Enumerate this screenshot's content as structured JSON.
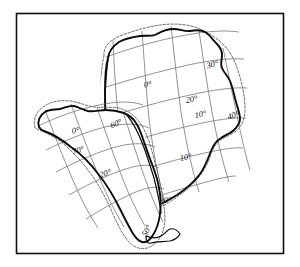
{
  "figure": {
    "caption": "",
    "background_color": "#ffffff",
    "frame_color": "#101010",
    "coastline_color": "#0b0b0b",
    "shelf_color": "#5a5a5a",
    "graticule_color": "#6e6e6e"
  },
  "frame": {
    "x": 16,
    "y": 13,
    "width": 268,
    "height": 241
  },
  "continents": [
    {
      "name": "africa",
      "label": "Africa",
      "grid_labels": [
        {
          "text": "0°",
          "x": 148,
          "y": 87,
          "rotate": -8
        },
        {
          "text": "30°",
          "x": 213,
          "y": 67,
          "rotate": -14
        },
        {
          "text": "20°",
          "x": 192,
          "y": 102,
          "rotate": -10
        },
        {
          "text": "10°",
          "x": 201,
          "y": 117,
          "rotate": -12
        },
        {
          "text": "40°",
          "x": 234,
          "y": 118,
          "rotate": -16
        },
        {
          "text": "10°",
          "x": 186,
          "y": 160,
          "rotate": -10
        },
        {
          "text": "30°",
          "x": 166,
          "y": 203,
          "rotate": -8
        }
      ]
    },
    {
      "name": "south-america",
      "label": "South America",
      "grid_labels": [
        {
          "text": "0°",
          "x": 76,
          "y": 133,
          "rotate": -10
        },
        {
          "text": "60°",
          "x": 117,
          "y": 126,
          "rotate": -22
        },
        {
          "text": "70°",
          "x": 79,
          "y": 153,
          "rotate": -18
        },
        {
          "text": "20°",
          "x": 106,
          "y": 176,
          "rotate": -16
        },
        {
          "text": "50°",
          "x": 149,
          "y": 232,
          "rotate": -62
        }
      ]
    }
  ],
  "legend": {
    "items": []
  }
}
